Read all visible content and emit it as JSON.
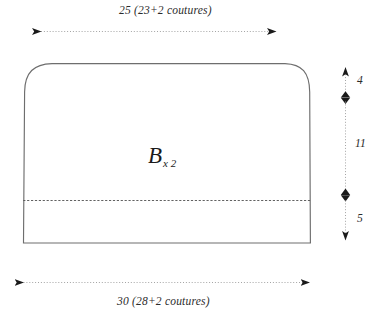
{
  "diagram": {
    "piece": {
      "letter": "B",
      "multiplier": "x 2"
    },
    "stroke_color": "#6e6e6e",
    "dim_color": "#8c8c8c",
    "text_color": "#2b2b2b",
    "background": "#ffffff",
    "dimensions": {
      "top": {
        "label": "25 (23+2 coutures)",
        "value": 25,
        "net": 23,
        "seam_allowance": 2,
        "unit_note": "coutures"
      },
      "bottom": {
        "label": "30 (28+2 coutures)",
        "value": 30,
        "net": 28,
        "seam_allowance": 2,
        "unit_note": "coutures"
      },
      "right_segments": [
        {
          "label": "4",
          "value": 4,
          "name": "curved-top-section"
        },
        {
          "label": "11",
          "value": 11,
          "name": "body-section"
        },
        {
          "label": "5",
          "value": 5,
          "name": "hem-section"
        }
      ]
    },
    "fold_line": {
      "name": "dashed-fold-line",
      "style": "dashed"
    }
  }
}
